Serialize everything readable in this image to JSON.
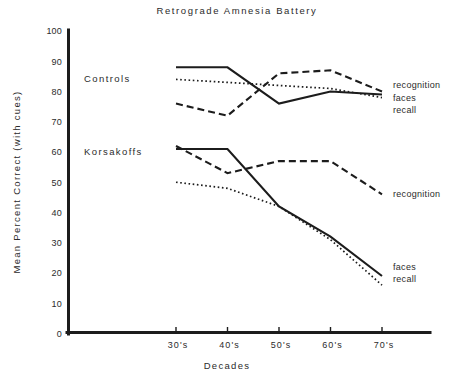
{
  "chart_data": {
    "type": "line",
    "title": "Retrograde  Amnesia  Battery",
    "xlabel": "Decades",
    "ylabel": "Mean  Percent  Correct  (with cues)",
    "categories": [
      "30's",
      "40's",
      "50's",
      "60's",
      "70's"
    ],
    "x": [
      30,
      40,
      50,
      60,
      70
    ],
    "ylim": [
      0,
      100
    ],
    "xlim": [
      25,
      76
    ],
    "yticks": [
      0,
      10,
      20,
      30,
      40,
      50,
      60,
      70,
      80,
      90,
      100
    ],
    "ytick_labels": [
      "0",
      "10",
      "20",
      "30",
      "40",
      "50",
      "60",
      "70",
      "80",
      "90",
      "100"
    ],
    "grid": false,
    "legend_position": "right-inline",
    "groups": [
      {
        "name": "Controls",
        "label": "Controls",
        "label_value": 84,
        "series": [
          {
            "name": "recognition",
            "label": "recognition",
            "style": "dashed",
            "values": [
              76,
              72,
              86,
              87,
              80
            ]
          },
          {
            "name": "faces",
            "label": "faces",
            "style": "solid",
            "values": [
              88,
              88,
              76,
              80,
              79
            ]
          },
          {
            "name": "recall",
            "label": "recall",
            "style": "dotted",
            "values": [
              84,
              83,
              82,
              81,
              78
            ]
          }
        ]
      },
      {
        "name": "Korsakoffs",
        "label": "Korsakoffs",
        "label_value": 60,
        "series": [
          {
            "name": "recognition",
            "label": "recognition",
            "style": "dashed",
            "values": [
              62,
              53,
              57,
              57,
              46
            ]
          },
          {
            "name": "faces",
            "label": "faces",
            "style": "solid",
            "values": [
              61,
              61,
              42,
              32,
              19
            ]
          },
          {
            "name": "recall",
            "label": "recall",
            "style": "dotted",
            "values": [
              50,
              48,
              42,
              31,
              16
            ]
          }
        ]
      }
    ],
    "series_labels_right": [
      {
        "text": "recognition",
        "group": "Controls",
        "value": 82
      },
      {
        "text": "faces",
        "group": "Controls",
        "value": 78
      },
      {
        "text": "recall",
        "group": "Controls",
        "value": 74
      },
      {
        "text": "recognition",
        "group": "Korsakoffs",
        "value": 46
      },
      {
        "text": "faces",
        "group": "Korsakoffs",
        "value": 22
      },
      {
        "text": "recall",
        "group": "Korsakoffs",
        "value": 18
      }
    ]
  }
}
